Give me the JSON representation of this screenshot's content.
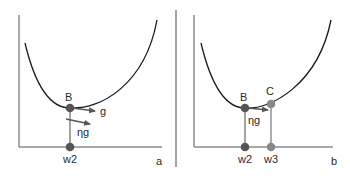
{
  "panels": [
    {
      "id": "a",
      "label": "a",
      "points": [
        {
          "name": "B",
          "label": "B"
        },
        {
          "name": "w2",
          "label": "w2"
        }
      ],
      "vectors": [
        {
          "name": "g",
          "label": "g"
        },
        {
          "name": "eta-g",
          "label": "ηg"
        }
      ]
    },
    {
      "id": "b",
      "label": "b",
      "points": [
        {
          "name": "B",
          "label": "B"
        },
        {
          "name": "C",
          "label": "C"
        },
        {
          "name": "w2",
          "label": "w2"
        },
        {
          "name": "w3",
          "label": "w3"
        }
      ],
      "vectors": [
        {
          "name": "eta-g",
          "label": "ηg"
        }
      ]
    }
  ],
  "colors": {
    "curve": "#1a1a1a",
    "axis": "#555555",
    "point_dark": "#555555",
    "point_light": "#888888",
    "arrow": "#555555",
    "divider": "#666666"
  }
}
